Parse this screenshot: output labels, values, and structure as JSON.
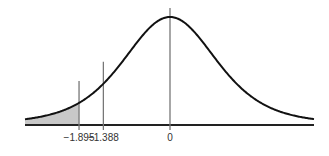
{
  "chart_data": {
    "type": "area",
    "title": "",
    "xlabel": "",
    "ylabel": "",
    "distribution": "t-distribution (bell curve)",
    "shaded_region": {
      "from": "-inf",
      "to": -1.895,
      "side": "left tail"
    },
    "vertical_markers": [
      -1.895,
      -1.388,
      0
    ],
    "tick_labels": [
      "−1.895",
      "−1.388",
      "0"
    ],
    "xlim": [
      -3.0,
      3.0
    ],
    "grid": false,
    "legend": null
  },
  "colors": {
    "curve": "#111111",
    "shade": "#c8c8c8",
    "marker": "#777777",
    "axis": "#222222"
  }
}
